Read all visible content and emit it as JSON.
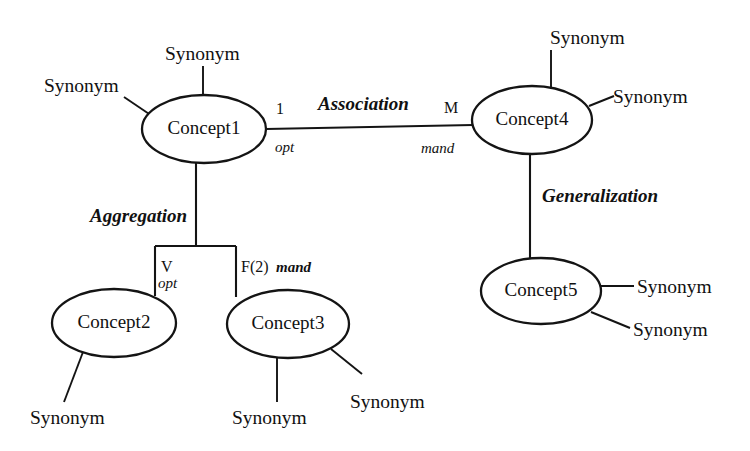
{
  "diagram": {
    "background_color": "#ffffff",
    "line_color": "#141414",
    "text_color": "#111111",
    "nodes": [
      {
        "id": "concept1",
        "label": "Concept1",
        "cx": 204,
        "cy": 129,
        "rx": 62,
        "ry": 34
      },
      {
        "id": "concept2",
        "label": "Concept2",
        "cx": 114,
        "cy": 323,
        "rx": 62,
        "ry": 34
      },
      {
        "id": "concept3",
        "label": "Concept3",
        "cx": 288,
        "cy": 324,
        "rx": 61,
        "ry": 34
      },
      {
        "id": "concept4",
        "label": "Concept4",
        "cx": 532,
        "cy": 120,
        "rx": 60,
        "ry": 34
      },
      {
        "id": "concept5",
        "label": "Concept5",
        "cx": 541,
        "cy": 291,
        "rx": 60,
        "ry": 33
      }
    ],
    "relationships": [
      {
        "id": "association",
        "label": "Association",
        "label_x": 318,
        "label_y": 110,
        "source": "concept1",
        "target": "concept4",
        "source_cardinality": "1",
        "source_modifier": "opt",
        "target_cardinality": "M",
        "target_modifier": "mand"
      },
      {
        "id": "aggregation",
        "label": "Aggregation",
        "label_x": 90,
        "label_y": 222,
        "source": "concept1",
        "targets": [
          "concept2",
          "concept3"
        ],
        "branch_left_cardinality": "V",
        "branch_left_modifier": "opt",
        "branch_right_cardinality": "F(2)",
        "branch_right_modifier": "mand"
      },
      {
        "id": "generalization",
        "label": "Generalization",
        "label_x": 542,
        "label_y": 202,
        "source": "concept4",
        "target": "concept5"
      }
    ],
    "synonyms": [
      {
        "id": "concept1-synonym-top",
        "label": "Synonym",
        "x": 165,
        "y": 60,
        "owner": "concept1"
      },
      {
        "id": "concept1-synonym-left",
        "label": "Synonym",
        "x": 44,
        "y": 92,
        "owner": "concept1"
      },
      {
        "id": "concept4-synonym-top",
        "label": "Synonym",
        "x": 550,
        "y": 44,
        "owner": "concept4"
      },
      {
        "id": "concept4-synonym-right",
        "label": "Synonym",
        "x": 613,
        "y": 103,
        "owner": "concept4"
      },
      {
        "id": "concept5-synonym-upper",
        "label": "Synonym",
        "x": 637,
        "y": 293,
        "owner": "concept5"
      },
      {
        "id": "concept5-synonym-lower",
        "label": "Synonym",
        "x": 633,
        "y": 336,
        "owner": "concept5"
      },
      {
        "id": "concept2-synonym",
        "label": "Synonym",
        "x": 30,
        "y": 424,
        "owner": "concept2"
      },
      {
        "id": "concept3-synonym-below",
        "label": "Synonym",
        "x": 232,
        "y": 424,
        "owner": "concept3"
      },
      {
        "id": "concept3-synonym-right",
        "label": "Synonym",
        "x": 350,
        "y": 408,
        "owner": "concept3"
      }
    ],
    "cardinality_labels": [
      {
        "id": "assoc-source-card",
        "text": "1",
        "x": 276,
        "y": 114
      },
      {
        "id": "assoc-source-mod",
        "text": "opt",
        "x": 275,
        "y": 152
      },
      {
        "id": "assoc-target-card",
        "text": "M",
        "x": 444,
        "y": 113
      },
      {
        "id": "assoc-target-mod",
        "text": "mand",
        "x": 421,
        "y": 153
      },
      {
        "id": "agg-left-card",
        "text": "V",
        "x": 161,
        "y": 272
      },
      {
        "id": "agg-left-mod",
        "text": "opt",
        "x": 160,
        "y": 288
      },
      {
        "id": "agg-right-card",
        "text": "F(2)",
        "x": 241,
        "y": 272
      },
      {
        "id": "agg-right-mod",
        "text": "mand",
        "x": 276,
        "y": 272
      }
    ]
  }
}
